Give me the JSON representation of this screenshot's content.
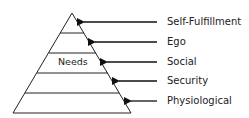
{
  "diagram": {
    "type": "pyramid",
    "center_label": "Needs",
    "levels": [
      {
        "label": "Self-Fulfillment",
        "y": 22,
        "tip_x": 85
      },
      {
        "label": "Ego",
        "y": 42,
        "tip_x": 95
      },
      {
        "label": "Social",
        "y": 62,
        "tip_x": 108
      },
      {
        "label": "Security",
        "y": 81,
        "tip_x": 119
      },
      {
        "label": "Physiological",
        "y": 101,
        "tip_x": 131
      }
    ]
  }
}
